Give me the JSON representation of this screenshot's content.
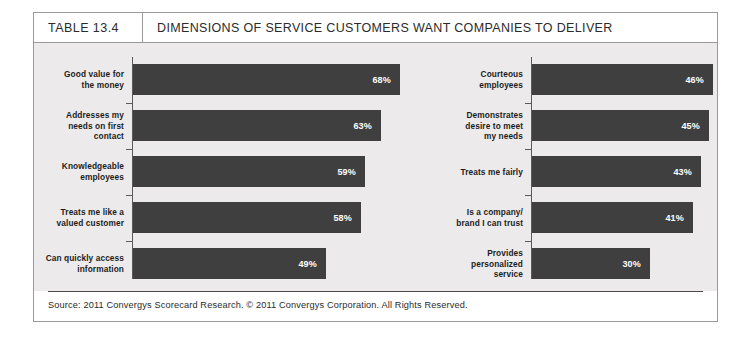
{
  "header": {
    "table_number": "TABLE 13.4",
    "title": "DIMENSIONS OF SERVICE CUSTOMERS WANT COMPANIES TO DELIVER"
  },
  "source": {
    "text": "Source: 2011 Convergys Scorecard Research. © 2011 Convergys Corporation. All Rights Reserved."
  },
  "colors": {
    "bar": "#3f3f3f",
    "panel_background": "#eceaea",
    "frame_border": "#9a9a9a",
    "value_text": "#ffffff",
    "label_text": "#1d1d1d"
  },
  "chart_data": {
    "type": "bar",
    "orientation": "horizontal",
    "title": "DIMENSIONS OF SERVICE CUSTOMERS WANT COMPANIES TO DELIVER",
    "xlabel": "",
    "ylabel": "",
    "xlim": [
      0,
      70
    ],
    "grid": false,
    "legend": "none",
    "value_suffix": "%",
    "panels": [
      {
        "name": "left-column",
        "categories": [
          "Good value for the money",
          "Addresses my needs on first contact",
          "Knowledgeable employees",
          "Treats me like a valued customer",
          "Can quickly access information"
        ],
        "category_lines": [
          [
            "Good value for",
            "the money"
          ],
          [
            "Addresses my",
            "needs on first",
            "contact"
          ],
          [
            "Knowledgeable",
            "employees"
          ],
          [
            "Treats me like a",
            "valued customer"
          ],
          [
            "Can quickly access",
            "information"
          ]
        ],
        "values": [
          68,
          63,
          59,
          58,
          49
        ],
        "labels": [
          "68%",
          "63%",
          "59%",
          "58%",
          "49%"
        ]
      },
      {
        "name": "right-column",
        "categories": [
          "Courteous employees",
          "Demonstrates desire to meet my needs",
          "Treats me fairly",
          "Is a company/ brand I can trust",
          "Provides personalized service"
        ],
        "category_lines": [
          [
            "Courteous",
            "employees"
          ],
          [
            "Demonstrates",
            "desire to meet",
            "my needs"
          ],
          [
            "Treats me fairly"
          ],
          [
            "Is a company/",
            "brand I can trust"
          ],
          [
            "Provides",
            "personalized",
            "service"
          ]
        ],
        "values": [
          46,
          45,
          43,
          41,
          30
        ],
        "labels": [
          "46%",
          "45%",
          "43%",
          "41%",
          "30%"
        ]
      }
    ]
  }
}
